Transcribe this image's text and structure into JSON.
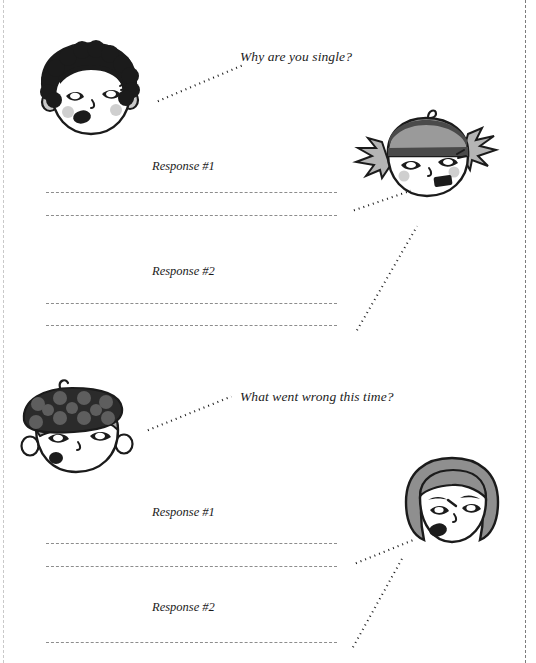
{
  "page": {
    "width": 536,
    "height": 663,
    "background": "#ffffff",
    "ink": "#1b1b1b",
    "rule_color": "#8d8d8d",
    "cut_line_color": "#7c7c7c"
  },
  "sections": [
    {
      "id": "section-1",
      "question": "Why are you single?",
      "asker": {
        "name": "afro-character",
        "hair": "black-afro",
        "hair_color": "#1b1b1b",
        "skin_color": "#ffffff",
        "cheek_color": "#c9c9c9",
        "expression": "talking"
      },
      "responder": {
        "name": "striped-beanie-character",
        "hair": "pigtails-with-striped-beanie",
        "hat_color_dark": "#4a4a4a",
        "hat_color_light": "#9a9a9a",
        "hair_color": "#b5b5b5",
        "skin_color": "#ffffff",
        "expression": "talking"
      },
      "responses": [
        {
          "label": "Response #1",
          "lines": 2
        },
        {
          "label": "Response #2",
          "lines": 2
        }
      ]
    },
    {
      "id": "section-2",
      "question": "What went wrong this time?",
      "asker": {
        "name": "polka-dot-beret-character",
        "hair": "gray-hair-with-polka-dot-beret",
        "hat_color": "#2b2b2b",
        "hat_dot_color": "#5e5e5e",
        "hair_color": "#a8a8a8",
        "skin_color": "#ffffff",
        "expression": "talking"
      },
      "responder": {
        "name": "gray-bob-character",
        "hair": "gray-bob",
        "hair_color": "#8f8f8f",
        "skin_color": "#ffffff",
        "expression": "angry-talking"
      },
      "responses": [
        {
          "label": "Response #1",
          "lines": 2
        },
        {
          "label": "Response #2",
          "lines": 1
        }
      ]
    }
  ],
  "icons": {
    "cut_line": "scissors-cut-guide",
    "leader": "dotted-leader-line",
    "writing_rule": "dashed-writing-rule"
  }
}
